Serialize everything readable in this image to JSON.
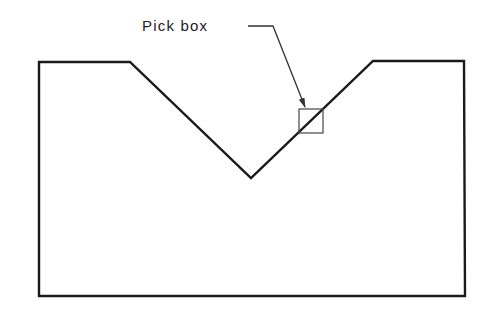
{
  "diagram": {
    "annotation": {
      "label": "Pick box",
      "label_x": 142,
      "label_y": 18
    },
    "colors": {
      "outline": "#1a1a1a",
      "leader": "#333333",
      "pickbox": "#444444",
      "text": "#222222",
      "background": "#ffffff"
    },
    "shape": {
      "name": "V-notch block",
      "points": [
        [
          39,
          62
        ],
        [
          130,
          62
        ],
        [
          251,
          178
        ],
        [
          373,
          61
        ],
        [
          464,
          61
        ],
        [
          465,
          296
        ],
        [
          39,
          296
        ]
      ]
    },
    "pick_box": {
      "x": 299,
      "y": 109,
      "size": 24
    },
    "leader": {
      "points": [
        [
          248,
          26
        ],
        [
          273,
          26
        ],
        [
          305,
          107
        ]
      ]
    }
  }
}
